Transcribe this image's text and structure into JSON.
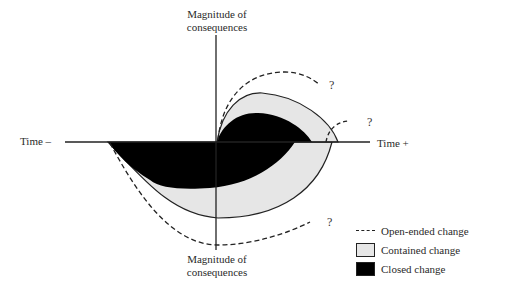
{
  "diagram": {
    "axes": {
      "top_label_line1": "Magnitude of",
      "top_label_line2": "consequences",
      "bottom_label_line1": "Magnitude of",
      "bottom_label_line2": "consequences",
      "left_label": "Time –",
      "right_label": "Time +"
    },
    "question_marks": [
      "?",
      "?",
      "?"
    ],
    "legend": {
      "items": [
        {
          "label": "Open-ended change",
          "style": "dashed-line"
        },
        {
          "label": "Contained change",
          "style": "light-gray-box"
        },
        {
          "label": "Closed change",
          "style": "black-box"
        }
      ]
    },
    "colors": {
      "closed": "#000000",
      "contained": "#e6e6e6",
      "line": "#222222"
    }
  }
}
